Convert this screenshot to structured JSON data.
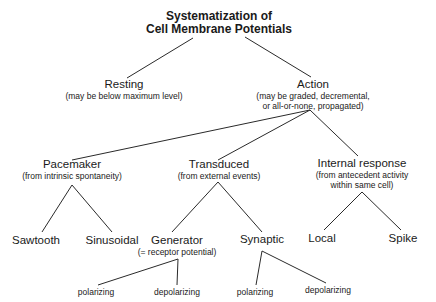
{
  "title": {
    "line1": "Systematization of",
    "line2": "Cell Membrane Potentials"
  },
  "nodes": {
    "resting": {
      "label": "Resting",
      "note": "(may be below maximum level)"
    },
    "action": {
      "label": "Action",
      "note_line1": "(may be graded, decremental,",
      "note_line2": "or all-or-none, propagated)"
    },
    "pacemaker": {
      "label": "Pacemaker",
      "note": "(from intrinsic spontaneity)"
    },
    "transduced": {
      "label": "Transduced",
      "note": "(from external events)"
    },
    "internal": {
      "label": "Internal response",
      "note_line1": "(from antecedent activity",
      "note_line2": "within same cell)"
    },
    "sawtooth": {
      "label": "Sawtooth"
    },
    "sinusoidal": {
      "label": "Sinusoidal"
    },
    "generator": {
      "label": "Generator",
      "note": "(= receptor potential)"
    },
    "synaptic": {
      "label": "Synaptic"
    },
    "local": {
      "label": "Local"
    },
    "spike": {
      "label": "Spike"
    },
    "gen_polarizing": {
      "label": "polarizing"
    },
    "gen_depolarizing": {
      "label": "depolarizing"
    },
    "syn_polarizing": {
      "label": "polarizing"
    },
    "syn_depolarizing": {
      "label": "depolarizing"
    }
  },
  "edges": [
    [
      "title",
      "resting"
    ],
    [
      "title",
      "action"
    ],
    [
      "action",
      "pacemaker"
    ],
    [
      "action",
      "transduced"
    ],
    [
      "action",
      "internal"
    ],
    [
      "pacemaker",
      "sawtooth"
    ],
    [
      "pacemaker",
      "sinusoidal"
    ],
    [
      "transduced",
      "generator"
    ],
    [
      "transduced",
      "synaptic"
    ],
    [
      "internal",
      "local"
    ],
    [
      "internal",
      "spike"
    ],
    [
      "generator",
      "gen_polarizing"
    ],
    [
      "generator",
      "gen_depolarizing"
    ],
    [
      "synaptic",
      "syn_polarizing"
    ],
    [
      "synaptic",
      "syn_depolarizing"
    ]
  ],
  "colors": {
    "line": "#2a2a2a",
    "text": "#1a1a1a",
    "background": "#ffffff"
  }
}
